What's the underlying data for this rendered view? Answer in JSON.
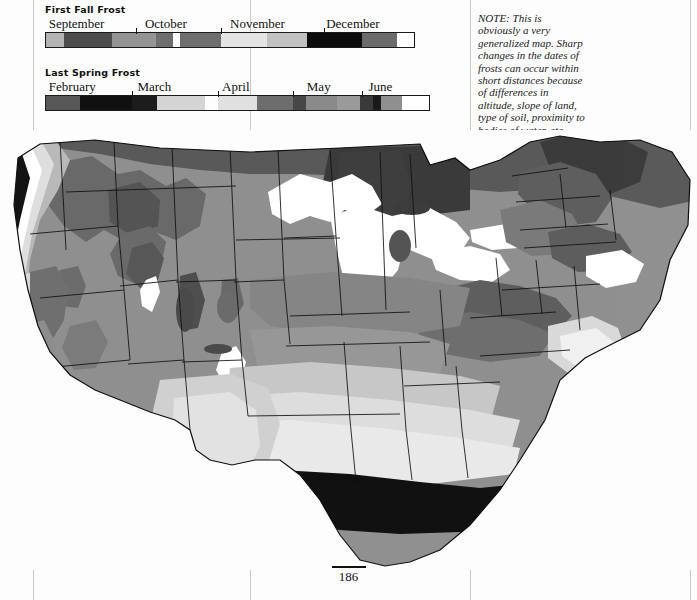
{
  "page": {
    "folio": "186",
    "background": "#fdfdfd"
  },
  "note": {
    "text": "NOTE: This is obviously a very generalized map. Sharp changes in the dates of frosts can occur within short distances because of differences in altitude, slope of land, type of soil, proximity to bodies of water, etc. Contact your local weather bureau for information."
  },
  "legends": [
    {
      "id": "first-fall-frost",
      "title": "First Fall Frost",
      "months": [
        {
          "label": "September",
          "left_pct": 1
        },
        {
          "label": "October",
          "left_pct": 27
        },
        {
          "label": "November",
          "left_pct": 50
        },
        {
          "label": "December",
          "left_pct": 76
        }
      ],
      "ticks_pct": [
        24.5,
        47.5,
        75.5
      ],
      "segments": [
        {
          "start_pct": 0.0,
          "end_pct": 5.0,
          "color": "#b4b4b4"
        },
        {
          "start_pct": 5.0,
          "end_pct": 18.0,
          "color": "#4d4d4d"
        },
        {
          "start_pct": 18.0,
          "end_pct": 30.0,
          "color": "#949494"
        },
        {
          "start_pct": 30.0,
          "end_pct": 34.5,
          "color": "#6f6f6f"
        },
        {
          "start_pct": 34.5,
          "end_pct": 36.5,
          "color": "#ffffff"
        },
        {
          "start_pct": 36.5,
          "end_pct": 47.5,
          "color": "#6e6e6e"
        },
        {
          "start_pct": 47.5,
          "end_pct": 60.0,
          "color": "#e4e4e4"
        },
        {
          "start_pct": 60.0,
          "end_pct": 71.0,
          "color": "#c2c2c2"
        },
        {
          "start_pct": 71.0,
          "end_pct": 86.0,
          "color": "#0d0d0d"
        },
        {
          "start_pct": 86.0,
          "end_pct": 95.5,
          "color": "#6b6b6b"
        },
        {
          "start_pct": 95.5,
          "end_pct": 100.0,
          "color": "#ffffff"
        }
      ]
    },
    {
      "id": "last-spring-frost",
      "title": "Last Spring Frost",
      "months": [
        {
          "label": "February",
          "left_pct": 1
        },
        {
          "label": "March",
          "left_pct": 24
        },
        {
          "label": "April",
          "left_pct": 46
        },
        {
          "label": "May",
          "left_pct": 68
        },
        {
          "label": "June",
          "left_pct": 84
        }
      ],
      "ticks_pct": [
        22.5,
        45.0,
        64.5,
        82.5
      ],
      "segments": [
        {
          "start_pct": 0.0,
          "end_pct": 9.0,
          "color": "#575757"
        },
        {
          "start_pct": 9.0,
          "end_pct": 22.5,
          "color": "#101010"
        },
        {
          "start_pct": 22.5,
          "end_pct": 29.0,
          "color": "#1c1c1c"
        },
        {
          "start_pct": 29.0,
          "end_pct": 41.5,
          "color": "#d4d4d4"
        },
        {
          "start_pct": 41.5,
          "end_pct": 45.0,
          "color": "#fdfdfd"
        },
        {
          "start_pct": 45.0,
          "end_pct": 55.0,
          "color": "#e0e0e0"
        },
        {
          "start_pct": 55.0,
          "end_pct": 64.5,
          "color": "#6d6d6d"
        },
        {
          "start_pct": 64.5,
          "end_pct": 68.0,
          "color": "#474747"
        },
        {
          "start_pct": 68.0,
          "end_pct": 76.0,
          "color": "#8a8a8a"
        },
        {
          "start_pct": 76.0,
          "end_pct": 82.0,
          "color": "#9a9a9a"
        },
        {
          "start_pct": 82.0,
          "end_pct": 85.5,
          "color": "#3a3a3a"
        },
        {
          "start_pct": 85.5,
          "end_pct": 87.5,
          "color": "#1a1a1a"
        },
        {
          "start_pct": 87.5,
          "end_pct": 93.0,
          "color": "#8f8f8f"
        },
        {
          "start_pct": 93.0,
          "end_pct": 100.0,
          "color": "#ffffff"
        }
      ]
    }
  ],
  "map": {
    "caption": "Generalized United States frost date map",
    "palette": {
      "zone_black": "#111111",
      "zone_darkest": "#3a3a3a",
      "zone_dark": "#5a5a5a",
      "zone_mid_dark": "#757575",
      "zone_mid": "#909090",
      "zone_light_mid": "#a8a8a8",
      "zone_light": "#c6c6c6",
      "zone_lighter": "#dcdcdc",
      "zone_pale": "#ececec",
      "zone_white": "#ffffff",
      "outline": "#111111"
    }
  }
}
